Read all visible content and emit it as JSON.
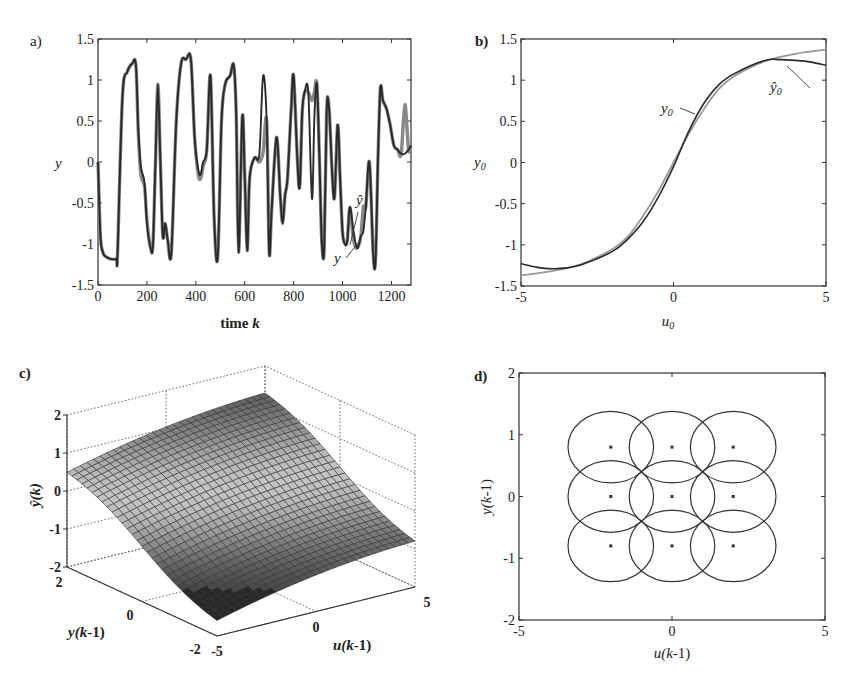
{
  "figure": {
    "panels": [
      {
        "id": "a",
        "label": "a)"
      },
      {
        "id": "b",
        "label": "b)"
      },
      {
        "id": "c",
        "label": "c)"
      },
      {
        "id": "d",
        "label": "d)"
      }
    ]
  },
  "chart_data": [
    {
      "panel": "a",
      "type": "line",
      "title": "",
      "xlabel": "time k",
      "ylabel": "y",
      "xlim": [
        0,
        1280
      ],
      "ylim": [
        -1.5,
        1.5
      ],
      "xticks": [
        "0",
        "200",
        "400",
        "600",
        "800",
        "1000",
        "1200"
      ],
      "yticks": [
        "1.5",
        "1",
        "0.5",
        "0",
        "-0.5",
        "-1",
        "-1.5"
      ],
      "grid": false,
      "annotations": [
        "y",
        "ŷ"
      ],
      "series": [
        {
          "name": "y",
          "x": [
            0,
            10,
            20,
            30,
            50,
            75,
            80,
            100,
            120,
            140,
            155,
            165,
            175,
            190,
            200,
            215,
            225,
            235,
            245,
            255,
            265,
            275,
            285,
            300,
            320,
            340,
            360,
            380,
            395,
            410,
            420,
            430,
            445,
            460,
            475,
            490,
            505,
            520,
            540,
            555,
            565,
            575,
            590,
            600,
            610,
            620,
            640,
            660,
            675,
            690,
            700,
            710,
            730,
            745,
            755,
            765,
            775,
            790,
            800,
            815,
            825,
            835,
            845,
            860,
            875,
            885,
            895,
            905,
            915,
            925,
            935,
            945,
            965,
            980,
            990,
            1000,
            1010,
            1020,
            1030,
            1045,
            1060,
            1075,
            1085,
            1095,
            1110,
            1125,
            1135,
            1145,
            1155,
            1165,
            1180,
            1195,
            1210,
            1225,
            1240,
            1255,
            1270,
            1280
          ],
          "y": [
            0,
            -0.9,
            -1.1,
            -1.15,
            -1.18,
            -1.18,
            -1.1,
            0.8,
            1.1,
            1.2,
            1.18,
            0.4,
            -0.05,
            -0.25,
            -0.75,
            -1.05,
            -1.0,
            0.0,
            0.95,
            0.0,
            -0.9,
            -0.75,
            -0.95,
            -1.1,
            0.5,
            1.2,
            1.25,
            1.25,
            0.3,
            -0.1,
            -0.15,
            0.0,
            0.15,
            1.05,
            -0.7,
            -1.15,
            0.5,
            0.95,
            1.05,
            1.18,
            0.6,
            -1.1,
            0.55,
            -0.15,
            -1.08,
            -0.2,
            0.05,
            0.1,
            1.05,
            0.5,
            -1.1,
            -0.6,
            0.3,
            -0.4,
            -0.75,
            -0.4,
            -0.2,
            0.65,
            1.05,
            0.05,
            -0.3,
            0.6,
            0.85,
            0.85,
            -0.45,
            0.55,
            0.95,
            0.1,
            -0.95,
            -1.05,
            0.6,
            0.65,
            -0.45,
            0.45,
            -0.2,
            -0.85,
            -1.0,
            -0.95,
            -0.55,
            -0.85,
            -1.05,
            -0.9,
            -0.85,
            -0.55,
            0.0,
            -1.1,
            -1.2,
            0.05,
            0.9,
            0.75,
            0.65,
            0.45,
            0.2,
            0.15,
            0.1,
            0.1,
            0.15,
            0.2
          ]
        },
        {
          "name": "ŷ",
          "x": [
            0,
            100,
            140,
            165,
            175,
            190,
            200,
            405,
            420,
            430,
            660,
            675,
            870,
            885,
            1050,
            1070,
            1085,
            1250,
            1260,
            1280
          ],
          "y": [
            0,
            0.8,
            1.2,
            0.35,
            -0.15,
            -0.3,
            -0.7,
            -0.15,
            -0.2,
            -0.05,
            0.0,
            0.12,
            0.75,
            0.85,
            -0.95,
            -0.9,
            -0.55,
            0.7,
            0.65,
            0.2
          ]
        }
      ]
    },
    {
      "panel": "b",
      "type": "line",
      "title": "",
      "xlabel": "u0",
      "ylabel": "y0",
      "xlim": [
        -5,
        5
      ],
      "ylim": [
        -1.5,
        1.5
      ],
      "xticks": [
        "-5",
        "0",
        "5"
      ],
      "yticks": [
        "1.5",
        "1",
        "0.5",
        "0",
        "-0.5",
        "-1",
        "-1.5"
      ],
      "grid": false,
      "annotations": [
        "y0",
        "ŷ0"
      ],
      "series": [
        {
          "name": "y0",
          "x": [
            -5,
            -4,
            -3,
            -2,
            -1.5,
            -1,
            -0.5,
            0,
            0.5,
            1,
            1.5,
            2,
            3,
            4,
            5
          ],
          "y": [
            -1.37,
            -1.32,
            -1.23,
            -1.05,
            -0.9,
            -0.65,
            -0.35,
            0,
            0.35,
            0.65,
            0.9,
            1.05,
            1.23,
            1.32,
            1.37
          ]
        },
        {
          "name": "ŷ0",
          "x": [
            -5,
            -4.5,
            -4,
            -3.5,
            -3,
            -2,
            -1.5,
            -1,
            -0.5,
            0,
            0.5,
            1,
            1.5,
            2,
            3,
            3.5,
            4,
            4.5,
            5
          ],
          "y": [
            -1.23,
            -1.27,
            -1.29,
            -1.28,
            -1.24,
            -1.08,
            -0.93,
            -0.72,
            -0.42,
            -0.05,
            0.38,
            0.72,
            0.95,
            1.08,
            1.24,
            1.25,
            1.24,
            1.22,
            1.18
          ]
        }
      ]
    },
    {
      "panel": "c",
      "type": "surface",
      "title": "",
      "xlabel": "u(k-1)",
      "ylabel": "y(k-1)",
      "zlabel": "ŷ(k)",
      "xlim": [
        -5,
        5
      ],
      "ylim": [
        -2,
        2
      ],
      "zlim": [
        -2,
        2
      ],
      "xticks": [
        "-5",
        "0",
        "5"
      ],
      "yticks": [
        "-2",
        "0",
        "2"
      ],
      "zticks": [
        "2",
        "1",
        "0",
        "-1",
        "-2"
      ],
      "grid": true,
      "corners": [
        {
          "u": -5,
          "y": 2,
          "z": 1.1
        },
        {
          "u": 5,
          "y": 2,
          "z": 1.9
        },
        {
          "u": -5,
          "y": -2,
          "z": -1.9
        },
        {
          "u": 5,
          "y": -2,
          "z": -1.1
        }
      ]
    },
    {
      "panel": "d",
      "type": "scatter",
      "title": "",
      "xlabel": "u(k-1)",
      "ylabel": "y(k-1)",
      "xlim": [
        -5,
        5
      ],
      "ylim": [
        -2,
        2
      ],
      "xticks": [
        "-5",
        "0",
        "5"
      ],
      "yticks": [
        "2",
        "1",
        "0",
        "-1",
        "-2"
      ],
      "grid": false,
      "centers_u": [
        -2,
        0,
        2
      ],
      "centers_y": [
        0.8,
        0,
        -0.8
      ],
      "ellipse_radius_u": 1.4,
      "ellipse_radius_y": 0.58
    }
  ],
  "labels": {
    "a_x": "time",
    "a_x_var": "k",
    "a_y": "y",
    "a_ann_y": "y",
    "a_ann_yhat": "ŷ",
    "b_x": "u",
    "b_x_sub": "0",
    "b_y": "y",
    "b_y_sub": "0",
    "b_ann_y0": "y",
    "b_ann_yhat0": "ŷ",
    "c_z": "ŷ(k)",
    "c_y_pre": "y(",
    "c_x_pre": "u(",
    "c_var": "k",
    "c_suffix": "-1)",
    "d_x_pre": "u(",
    "d_y_pre": "y(",
    "d_var": "k",
    "d_suffix": "-1)"
  }
}
